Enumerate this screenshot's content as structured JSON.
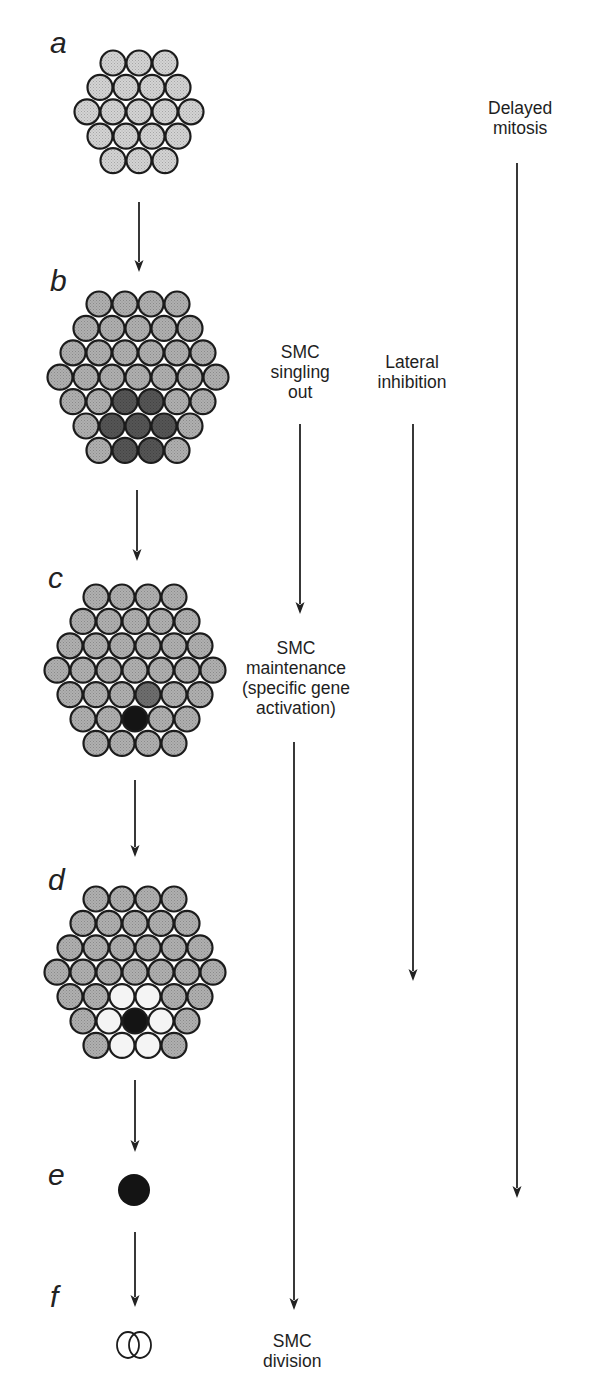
{
  "figure": {
    "colors": {
      "cell_light": "#d4d4d4",
      "cell_medium": "#b0b0b0",
      "cell_dark": "#555555",
      "cell_medium_dark": "#6e6e6e",
      "cell_black": "#141414",
      "cell_white": "#f4f4f4",
      "outline": "#1c1c1c",
      "arrow": "#222222"
    },
    "cell_size": {
      "spacing": 26,
      "row_step": 24.4,
      "radius": 12.5
    }
  },
  "panels": [
    {
      "id": "a",
      "letter": "a",
      "letter_pos": [
        50,
        28
      ],
      "center_x": 139,
      "top_y": 63,
      "rows": [
        3,
        4,
        5,
        4,
        3
      ],
      "base_fill": "light",
      "special": []
    },
    {
      "id": "b",
      "letter": "b",
      "letter_pos": [
        50,
        266
      ],
      "center_x": 138,
      "top_y": 304,
      "rows": [
        4,
        5,
        6,
        7,
        6,
        5,
        4
      ],
      "base_fill": "medium",
      "special": [
        {
          "row": 4,
          "col": 2,
          "fill": "dark"
        },
        {
          "row": 4,
          "col": 3,
          "fill": "dark"
        },
        {
          "row": 5,
          "col": 1,
          "fill": "dark"
        },
        {
          "row": 5,
          "col": 2,
          "fill": "dark"
        },
        {
          "row": 5,
          "col": 3,
          "fill": "dark"
        },
        {
          "row": 6,
          "col": 1,
          "fill": "dark"
        },
        {
          "row": 6,
          "col": 2,
          "fill": "dark"
        }
      ]
    },
    {
      "id": "c",
      "letter": "c",
      "letter_pos": [
        48,
        563
      ],
      "center_x": 135,
      "top_y": 597,
      "rows": [
        4,
        5,
        6,
        7,
        6,
        5,
        4
      ],
      "base_fill": "medium",
      "special": [
        {
          "row": 4,
          "col": 3,
          "fill": "medium_dark"
        },
        {
          "row": 5,
          "col": 2,
          "fill": "black"
        }
      ]
    },
    {
      "id": "d",
      "letter": "d",
      "letter_pos": [
        48,
        865
      ],
      "center_x": 135,
      "top_y": 899,
      "rows": [
        4,
        5,
        6,
        7,
        6,
        5,
        4
      ],
      "base_fill": "medium",
      "special": [
        {
          "row": 4,
          "col": 2,
          "fill": "white"
        },
        {
          "row": 4,
          "col": 3,
          "fill": "white"
        },
        {
          "row": 5,
          "col": 1,
          "fill": "white"
        },
        {
          "row": 5,
          "col": 2,
          "fill": "black"
        },
        {
          "row": 5,
          "col": 3,
          "fill": "white"
        },
        {
          "row": 6,
          "col": 1,
          "fill": "white"
        },
        {
          "row": 6,
          "col": 2,
          "fill": "white"
        }
      ]
    },
    {
      "id": "e",
      "letter": "e",
      "letter_pos": [
        48,
        1160
      ],
      "single_cell": {
        "cx": 134,
        "cy": 1190,
        "r": 16,
        "fill": "black"
      }
    },
    {
      "id": "f",
      "letter": "f",
      "letter_pos": [
        50,
        1282
      ],
      "dividing_cell": {
        "cx": 134,
        "cy": 1345,
        "rx": 17,
        "ry": 20
      }
    }
  ],
  "stage_arrows": [
    {
      "from": "a",
      "to": "b",
      "x": 139,
      "y1": 202,
      "y2": 272
    },
    {
      "from": "b",
      "to": "c",
      "x": 137,
      "y1": 490,
      "y2": 561
    },
    {
      "from": "c",
      "to": "d",
      "x": 135,
      "y1": 780,
      "y2": 857
    },
    {
      "from": "d",
      "to": "e",
      "x": 135,
      "y1": 1080,
      "y2": 1152
    },
    {
      "from": "e",
      "to": "f",
      "x": 135,
      "y1": 1232,
      "y2": 1307
    }
  ],
  "process_labels": [
    {
      "id": "smc-singling-out",
      "text": "SMC\nsingling\nout",
      "x": 300,
      "y": 342
    },
    {
      "id": "lateral-inhibition",
      "text": "Lateral\ninhibition",
      "x": 412,
      "y": 352
    },
    {
      "id": "delayed-mitosis",
      "text": "Delayed\nmitosis",
      "x": 520,
      "y": 98
    },
    {
      "id": "smc-maintenance",
      "text": "SMC\nmaintenance\n(specific gene\nactivation)",
      "x": 296,
      "y": 638
    },
    {
      "id": "smc-division",
      "text": "SMC\ndivision",
      "x": 292,
      "y": 1331
    }
  ],
  "process_arrows": [
    {
      "id": "singling-out-arrow",
      "x": 300,
      "y1": 424,
      "y2": 614
    },
    {
      "id": "lateral-inhibition-arrow",
      "x": 413,
      "y1": 424,
      "y2": 981
    },
    {
      "id": "delayed-mitosis-arrow",
      "x": 517,
      "y1": 163,
      "y2": 1198
    },
    {
      "id": "maintenance-arrow",
      "x": 294,
      "y1": 742,
      "y2": 1310
    }
  ]
}
